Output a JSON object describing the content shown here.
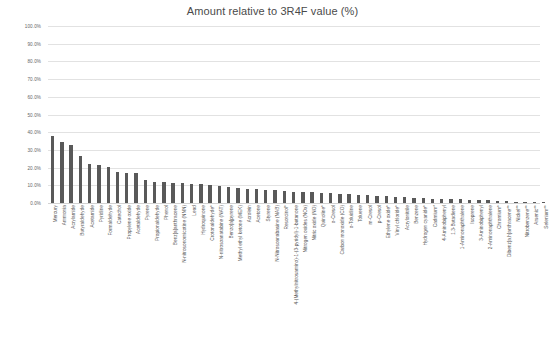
{
  "chart_data": {
    "type": "bar",
    "title": "Amount relative to 3R4F value (%)",
    "xlabel": "",
    "ylabel": "",
    "ylim": [
      0,
      100
    ],
    "ytick_labels": [
      "0.0%",
      "10.0%",
      "20.0%",
      "30.0%",
      "40.0%",
      "50.0%",
      "60.0%",
      "70.0%",
      "80.0%",
      "90.0%",
      "100.0%"
    ],
    "ytick_values": [
      0,
      10,
      20,
      30,
      40,
      50,
      60,
      70,
      80,
      90,
      100
    ],
    "grid": true,
    "legend": "none",
    "bar_color": "#595959",
    "categories": [
      "Mercury",
      "Ammonia",
      "Acrylamide",
      "Butyraldehyde",
      "Acetamide",
      "Pyridine",
      "Formaldehyde",
      "Catechol",
      "Propylene oxide",
      "Acetaldehyde",
      "Pyrene",
      "Propionaldehyde",
      "Phenol",
      "Benz[a]anthracene",
      "N-nitrosonornicotine (NNN)",
      "Lead",
      "Hydroquinone",
      "Crotonaldehyde*",
      "N-nitrosoanatabine (NAT)",
      "Benzo[a]pyrene",
      "Methyl ethyl ketone (MEK)",
      "Acrolein",
      "Acetone",
      "Styrene",
      "N-Nitrosoanabasine (NAB)",
      "Resorcinol*",
      "4-(Methylnitrosamino)-1-(3-pyridyl)-1-butanone",
      "Nitrogen oxides (NOx)",
      "Nitric oxide (NO)",
      "Quinoline*",
      "o-Cresol",
      "Carbon monoxide (CO)",
      "o-Toluidine",
      "Toluene",
      "m-Cresol",
      "p-Cresol",
      "Ethylene oxide*",
      "Vinyl chloride*",
      "Acrylonitrile",
      "Benzene",
      "Hydrogen cyanide*",
      "Cadmium*",
      "4-Aminobiphenyl",
      "1,3-Butadiene",
      "1-Aminonaphthalene",
      "Isoprene",
      "3-Aminobiphenyl",
      "2-Aminonaphthalene",
      "Chromium*",
      "Dibenz[a,h]anthracene**",
      "Nickel**",
      "Nitrobenzene**",
      "Arsenic**",
      "Selenium**"
    ],
    "values": [
      38.0,
      34.5,
      33.0,
      26.5,
      22.0,
      21.5,
      20.5,
      17.5,
      17.0,
      17.0,
      13.0,
      12.0,
      12.0,
      11.5,
      11.5,
      11.0,
      10.5,
      10.0,
      9.5,
      9.0,
      8.5,
      8.0,
      8.0,
      7.5,
      7.5,
      7.0,
      6.5,
      6.0,
      6.0,
      5.5,
      5.5,
      5.0,
      5.0,
      4.5,
      4.5,
      4.0,
      4.0,
      3.5,
      3.5,
      3.0,
      3.0,
      2.5,
      2.5,
      2.0,
      2.0,
      1.8,
      1.5,
      1.5,
      1.2,
      1.0,
      0.8,
      0.6,
      0.4,
      0.2
    ]
  }
}
